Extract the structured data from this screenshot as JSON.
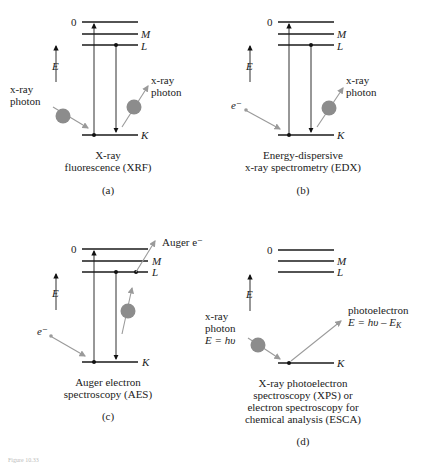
{
  "figure": {
    "caption_partial": "Figure 10.33"
  },
  "axis": {
    "energy_label": "E"
  },
  "levels": {
    "zero": "0",
    "M": "M",
    "L": "L",
    "K": "K"
  },
  "panels": [
    {
      "id": "a",
      "letter": "(a)",
      "title_lines": [
        "X-ray",
        "fluorescence (XRF)"
      ],
      "incoming_label": [
        "x-ray",
        "photon"
      ],
      "outgoing_label": [
        "x-ray",
        "photon"
      ]
    },
    {
      "id": "b",
      "letter": "(b)",
      "title_lines": [
        "Energy-dispersive",
        "x-ray spectrometry (EDX)"
      ],
      "incoming_label": [
        "e⁻"
      ],
      "outgoing_label": [
        "x-ray",
        "photon"
      ]
    },
    {
      "id": "c",
      "letter": "(c)",
      "title_lines": [
        "Auger electron",
        "spectroscopy (AES)"
      ],
      "incoming_label": [
        "e⁻"
      ],
      "outgoing_label": [
        "Auger e⁻"
      ]
    },
    {
      "id": "d",
      "letter": "(d)",
      "title_lines": [
        "X-ray photoelectron",
        "spectroscopy (XPS) or",
        "electron spectroscopy for",
        "chemical analysis (ESCA)"
      ],
      "incoming_label": [
        "x-ray",
        "photon",
        "E = hυ"
      ],
      "outgoing_label": [
        "photoelectron",
        "E = hυ – E_K"
      ]
    }
  ]
}
